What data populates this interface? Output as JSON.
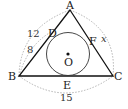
{
  "diagram": {
    "type": "triangle-incircle",
    "vertices": {
      "A": "A",
      "B": "B",
      "C": "C"
    },
    "tangent_points": {
      "D": "D",
      "E": "E",
      "F": "F"
    },
    "center": "O",
    "lengths": {
      "AB": "12",
      "BD": "8",
      "BC": "15",
      "AC": "x"
    },
    "colors": {
      "lines": "#111111",
      "arcs": "#aaaaaa"
    }
  }
}
